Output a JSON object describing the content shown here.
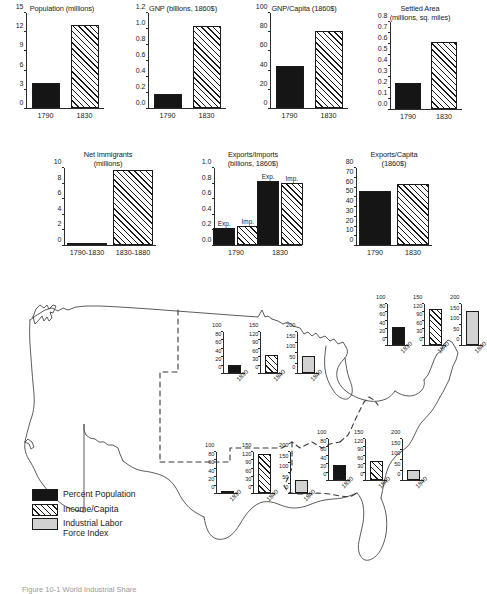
{
  "figure": {
    "caption": "Figure 10-1   World Industrial Share",
    "map_region_name": "united-states-1840"
  },
  "legend": {
    "items": [
      {
        "label": "Percent Population",
        "pattern": "solid",
        "color": "#151515"
      },
      {
        "label": "Income/Capita",
        "pattern": "hatch",
        "color": "#ffffff"
      },
      {
        "label": "Industrial Labor\nForce Index",
        "pattern": "gray",
        "color": "#d2d2d2"
      }
    ]
  },
  "chart_data": [
    {
      "id": "population",
      "type": "bar",
      "title": "Population (millions)",
      "categories": [
        "1790",
        "1830"
      ],
      "values": [
        3.9,
        12.9
      ],
      "patterns": [
        "solid",
        "hatch"
      ],
      "yticks": [
        0,
        3,
        6,
        9,
        12,
        15
      ],
      "ylim": [
        0,
        15
      ],
      "xlabel": "",
      "ylabel": ""
    },
    {
      "id": "gnp",
      "type": "bar",
      "title": "GNP (billions, 1860$)",
      "categories": [
        "1790",
        "1830"
      ],
      "values": [
        0.17,
        1.02
      ],
      "patterns": [
        "solid",
        "hatch"
      ],
      "yticks": [
        0.0,
        0.2,
        0.4,
        0.6,
        0.8,
        1.0,
        1.2
      ],
      "ytick_labels": [
        "0.0",
        "0.2",
        "0.4",
        "0.6",
        "0.8",
        "1.0",
        "1.2"
      ],
      "ylim": [
        0,
        1.2
      ],
      "xlabel": "",
      "ylabel": ""
    },
    {
      "id": "gnp-capita",
      "type": "bar",
      "title": "GNP/Capita (1860$)",
      "categories": [
        "1790",
        "1830"
      ],
      "values": [
        44,
        80
      ],
      "patterns": [
        "solid",
        "hatch"
      ],
      "yticks": [
        0,
        20,
        40,
        60,
        80,
        100
      ],
      "ylim": [
        0,
        100
      ],
      "xlabel": "",
      "ylabel": ""
    },
    {
      "id": "settled-area",
      "type": "bar",
      "title": "Settled Area\n(millions, sq. miles)",
      "categories": [
        "1790",
        "1830"
      ],
      "values": [
        0.24,
        0.61
      ],
      "patterns": [
        "solid",
        "hatch"
      ],
      "yticks": [
        0.0,
        0.1,
        0.2,
        0.3,
        0.4,
        0.5,
        0.6,
        0.7,
        0.8
      ],
      "ytick_labels": [
        "0.0",
        "0.1",
        "0.2",
        "0.3",
        "0.4",
        "0.5",
        "0.6",
        "0.7",
        "0.8"
      ],
      "ylim": [
        0,
        0.8
      ],
      "xlabel": "",
      "ylabel": ""
    },
    {
      "id": "net-immigrants",
      "type": "bar",
      "title": "Net Immigrants\n(millions)",
      "categories": [
        "1790-1830",
        "1830-1880"
      ],
      "values": [
        0.15,
        9.6
      ],
      "patterns": [
        "solid",
        "hatch"
      ],
      "yticks": [
        0,
        2,
        4,
        6,
        8,
        10
      ],
      "ylim": [
        0,
        10
      ],
      "xlabel": "",
      "ylabel": ""
    },
    {
      "id": "exports-imports",
      "type": "bar",
      "title": "Exports/Imports\n(billions, 1860$)",
      "categories": [
        "1790",
        "1830"
      ],
      "series": [
        {
          "name": "Exp.",
          "values": [
            0.22,
            0.82
          ],
          "pattern": "solid"
        },
        {
          "name": "Imp.",
          "values": [
            0.24,
            0.79
          ],
          "pattern": "hatch"
        }
      ],
      "bar_labels": [
        "Exp.",
        "Imp.",
        "Exp.",
        "Imp."
      ],
      "yticks": [
        0.0,
        0.2,
        0.4,
        0.6,
        0.8,
        1.0
      ],
      "ytick_labels": [
        "0.0",
        "0.2",
        "0.4",
        "0.6",
        "0.8",
        "1.0"
      ],
      "ylim": [
        0,
        1.0
      ],
      "xlabel": "",
      "ylabel": ""
    },
    {
      "id": "exports-capita",
      "type": "bar",
      "title": "Exports/Capita\n(1860$)",
      "categories": [
        "1790",
        "1830"
      ],
      "values": [
        55,
        63
      ],
      "patterns": [
        "solid",
        "hatch"
      ],
      "yticks": [
        0,
        10,
        20,
        30,
        40,
        50,
        60,
        70,
        80
      ],
      "ylim": [
        0,
        80
      ],
      "xlabel": "",
      "ylabel": ""
    },
    {
      "id": "inset-northwest",
      "type": "bar",
      "region": "Northwest",
      "mini_charts": [
        {
          "series": "Percent Population",
          "value": 18,
          "year": "1830",
          "yticks": [
            0,
            20,
            40,
            60,
            80,
            100
          ],
          "ylim": [
            0,
            100
          ],
          "pattern": "solid"
        },
        {
          "series": "Income/Capita",
          "value": 63,
          "year": "1840",
          "yticks": [
            0,
            30,
            60,
            90,
            120,
            150
          ],
          "ylim": [
            0,
            150
          ],
          "pattern": "hatch"
        },
        {
          "series": "Industrial Labor Force Index",
          "value": 83,
          "year": "1840",
          "yticks": [
            0,
            50,
            100,
            150,
            200
          ],
          "ylim": [
            0,
            200
          ],
          "pattern": "gray"
        }
      ]
    },
    {
      "id": "inset-northeast",
      "type": "bar",
      "region": "Northeast",
      "mini_charts": [
        {
          "series": "Percent Population",
          "value": 43,
          "year": "1830",
          "yticks": [
            0,
            20,
            40,
            60,
            80,
            100
          ],
          "ylim": [
            0,
            100
          ],
          "pattern": "solid"
        },
        {
          "series": "Income/Capita",
          "value": 127,
          "year": "1840",
          "yticks": [
            0,
            30,
            60,
            90,
            120,
            150
          ],
          "ylim": [
            0,
            150
          ],
          "pattern": "hatch"
        },
        {
          "series": "Industrial Labor Force Index",
          "value": 162,
          "year": "1840",
          "yticks": [
            0,
            50,
            100,
            150,
            200
          ],
          "ylim": [
            0,
            200
          ],
          "pattern": "gray"
        }
      ]
    },
    {
      "id": "inset-southwest",
      "type": "bar",
      "region": "Southwest",
      "mini_charts": [
        {
          "series": "Percent Population",
          "value": 3,
          "year": "1830",
          "yticks": [
            0,
            20,
            40,
            60,
            80,
            100
          ],
          "ylim": [
            0,
            100
          ],
          "pattern": "solid"
        },
        {
          "series": "Income/Capita",
          "value": 140,
          "year": "1840",
          "yticks": [
            0,
            30,
            60,
            90,
            120,
            150
          ],
          "ylim": [
            0,
            150
          ],
          "pattern": "hatch"
        },
        {
          "series": "Industrial Labor Force Index",
          "value": 62,
          "year": "1840",
          "yticks": [
            0,
            50,
            100,
            150,
            200
          ],
          "ylim": [
            0,
            200
          ],
          "pattern": "gray"
        }
      ]
    },
    {
      "id": "inset-southeast",
      "type": "bar",
      "region": "Southeast",
      "mini_charts": [
        {
          "series": "Percent Population",
          "value": 35,
          "year": "1830",
          "yticks": [
            0,
            20,
            40,
            60,
            80,
            100
          ],
          "ylim": [
            0,
            100
          ],
          "pattern": "solid"
        },
        {
          "series": "Income/Capita",
          "value": 68,
          "year": "1840",
          "yticks": [
            0,
            30,
            60,
            90,
            120,
            150
          ],
          "ylim": [
            0,
            150
          ],
          "pattern": "hatch"
        },
        {
          "series": "Industrial Labor Force Index",
          "value": 50,
          "year": "1840",
          "yticks": [
            0,
            50,
            100,
            150,
            200
          ],
          "ylim": [
            0,
            200
          ],
          "pattern": "gray"
        }
      ]
    }
  ]
}
